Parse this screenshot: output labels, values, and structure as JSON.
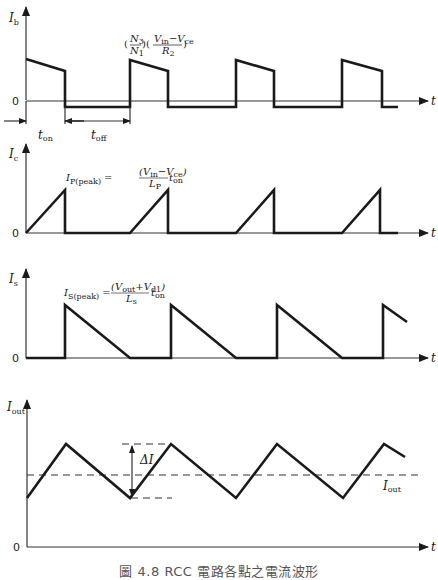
{
  "figure": {
    "caption": "圖 4.8 RCC 電路各點之電流波形",
    "time_axis_label": "t",
    "zero_label": "0"
  },
  "panels": [
    {
      "id": "ib",
      "y_label": "I",
      "y_label_sub": "b",
      "annotation": "(N3/N1)((Vin − Vce)/R2)",
      "annotation_parts": {
        "n_num": "N",
        "n_num_sub": "3",
        "n_den": "N",
        "n_den_sub": "1",
        "v_num": "V",
        "v_in_sub": "in",
        "minus": "−",
        "v_ce": "V",
        "v_ce_sub": "ce",
        "r_den": "R",
        "r_den_sub": "2"
      }
    },
    {
      "id": "ic",
      "y_label": "I",
      "y_label_sub": "c",
      "annotation": "I_P(peak) = ((Vin − Vce)/Lp) t_on",
      "annotation_parts": {
        "lhs": "I",
        "lhs_sub": "P(peak)",
        "eq": "=",
        "num": "(V",
        "num_sub1": "in",
        "num_mid": "−V",
        "num_sub2": "ce",
        "num_end": ")",
        "den": "L",
        "den_sub": "P",
        "t": "t",
        "t_sub": "on"
      }
    },
    {
      "id": "is",
      "y_label": "I",
      "y_label_sub": "s",
      "annotation": "I_S(peak) = ((Vout + Vd1)/Ls) t_on",
      "annotation_parts": {
        "lhs": "I",
        "lhs_sub": "S(peak)",
        "eq": "=",
        "num": "(V",
        "num_sub1": "out",
        "num_mid": "+V",
        "num_sub2": "d1",
        "num_end": ")",
        "den": "L",
        "den_sub": "s",
        "t": "t",
        "t_sub": "on"
      }
    },
    {
      "id": "iout",
      "y_label": "I",
      "y_label_sub": "out",
      "ripple_label": "ΔI",
      "mean_label": "I",
      "mean_label_sub": "out"
    }
  ],
  "timing": {
    "t_on": "t",
    "t_on_sub": "on",
    "t_off": "t",
    "t_off_sub": "off"
  }
}
